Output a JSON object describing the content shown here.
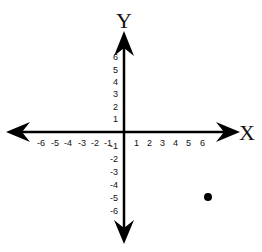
{
  "diagram": {
    "type": "coordinate-plane",
    "axis_labels": {
      "x": "X",
      "y": "Y"
    },
    "x_ticks": [
      {
        "label": "-6",
        "value": -6
      },
      {
        "label": "-5",
        "value": -5
      },
      {
        "label": "-4",
        "value": -4
      },
      {
        "label": "-3",
        "value": -3
      },
      {
        "label": "-2",
        "value": -2
      },
      {
        "label": "-1",
        "value": -1
      },
      {
        "label": "1",
        "value": 1
      },
      {
        "label": "2",
        "value": 2
      },
      {
        "label": "3",
        "value": 3
      },
      {
        "label": "4",
        "value": 4
      },
      {
        "label": "5",
        "value": 5
      },
      {
        "label": "6",
        "value": 6
      }
    ],
    "y_ticks": [
      {
        "label": "6",
        "value": 6
      },
      {
        "label": "5",
        "value": 5
      },
      {
        "label": "4",
        "value": 4
      },
      {
        "label": "3",
        "value": 3
      },
      {
        "label": "2",
        "value": 2
      },
      {
        "label": "1",
        "value": 1
      },
      {
        "label": "-1",
        "value": -1
      },
      {
        "label": "-2",
        "value": -2
      },
      {
        "label": "-3",
        "value": -3
      },
      {
        "label": "-4",
        "value": -4
      },
      {
        "label": "-5",
        "value": -5
      },
      {
        "label": "-6",
        "value": -6
      }
    ],
    "points": [
      {
        "x": 6.5,
        "y": -5,
        "color": "#000000"
      }
    ],
    "colors": {
      "axis": "#000000",
      "text": "#111111",
      "background": "#ffffff"
    },
    "range": {
      "x": [
        -6,
        6
      ],
      "y": [
        -6,
        6
      ]
    }
  }
}
